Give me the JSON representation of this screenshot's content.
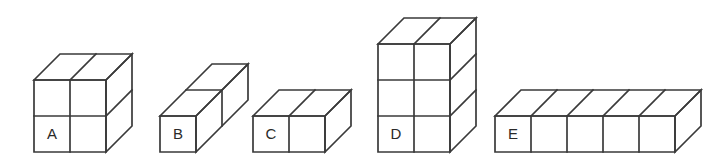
{
  "figure": {
    "background_color": "#ffffff",
    "line_color": "#3a3a3a",
    "label_color": "#2a2a2a",
    "projection": "oblique-cabinet",
    "cube_unit_px": 36,
    "depth_offset_px": 26,
    "baseline_y": 152,
    "solids": [
      {
        "label": "A",
        "name": "solid-a",
        "columns": 2,
        "rows": 2,
        "depth": 1,
        "total_cubes": 8,
        "origin_x": 34,
        "label_cell": "bottom-left"
      },
      {
        "label": "B",
        "name": "solid-b",
        "columns": 1,
        "rows": 1,
        "depth": 2,
        "total_cubes": 2,
        "origin_x": 160,
        "label_cell": "bottom-left"
      },
      {
        "label": "C",
        "name": "solid-c",
        "columns": 2,
        "rows": 1,
        "depth": 1,
        "total_cubes": 4,
        "origin_x": 253,
        "label_cell": "bottom-left"
      },
      {
        "label": "D",
        "name": "solid-d",
        "columns": 2,
        "rows": 3,
        "depth": 1,
        "total_cubes": 12,
        "origin_x": 378,
        "label_cell": "bottom-left"
      },
      {
        "label": "E",
        "name": "solid-e",
        "columns": 5,
        "rows": 1,
        "depth": 1,
        "total_cubes": 5,
        "origin_x": 495,
        "label_cell": "bottom-left"
      }
    ]
  }
}
